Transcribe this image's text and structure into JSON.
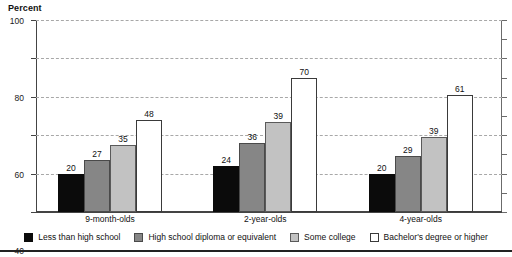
{
  "chart_data": {
    "type": "bar",
    "title": "",
    "xlabel": "",
    "ylabel": "Percent",
    "ylim": [
      0,
      100
    ],
    "yticks": [
      0,
      20,
      40,
      60,
      80,
      100
    ],
    "ytick_labels": [
      "0",
      "20",
      "40",
      "60",
      "80",
      "100"
    ],
    "grid": true,
    "grid_axis": "y",
    "grid_style": "dashed",
    "legend_position": "bottom",
    "categories": [
      "9-month-olds",
      "2-year-olds",
      "4-year-olds"
    ],
    "series": [
      {
        "name": "Less than high school",
        "color": "#0b0b0b",
        "values": [
          20,
          24,
          20
        ],
        "labels": [
          "20",
          "24",
          "20"
        ]
      },
      {
        "name": "High school diploma or equivalent",
        "color": "#868686",
        "values": [
          27,
          36,
          29
        ],
        "labels": [
          "27",
          "36",
          "29"
        ]
      },
      {
        "name": "Some college",
        "color": "#c2c2c2",
        "values": [
          35,
          47,
          39
        ],
        "labels": [
          "35",
          "39",
          "39"
        ]
      },
      {
        "name": "Bachelor's degree or higher",
        "color": "#ffffff",
        "values": [
          48,
          70,
          61
        ],
        "labels": [
          "48",
          "70",
          "61"
        ]
      }
    ]
  },
  "axis": {
    "y_title": "Percent"
  },
  "legend": {
    "items": [
      {
        "label": "Less than high school"
      },
      {
        "label": "High school diploma or equivalent"
      },
      {
        "label": "Some college"
      },
      {
        "label": "Bachelor's degree or higher"
      }
    ]
  },
  "colors": {
    "series_0": "#0b0b0b",
    "series_1": "#868686",
    "series_2": "#c2c2c2",
    "series_3": "#ffffff",
    "axis": "#444444",
    "gridline": "#a8a8a8",
    "background": "#ffffff"
  }
}
